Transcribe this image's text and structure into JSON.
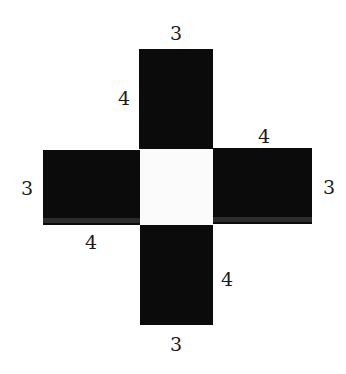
{
  "figure": {
    "faces": {
      "top": {
        "label_top": "3",
        "label_left": "4"
      },
      "left": {
        "label_left": "3",
        "label_bottom": "4"
      },
      "right": {
        "label_top": "4",
        "label_right": "3"
      },
      "bottom": {
        "label_right": "4",
        "label_bottom": "3"
      },
      "center": {
        "fill": "#fbfbfb"
      }
    },
    "colors": {
      "face_fill": "#0b0b0b",
      "background": "#ffffff",
      "label": "#1a1a1a"
    }
  }
}
